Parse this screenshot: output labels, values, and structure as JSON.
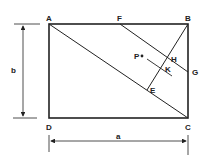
{
  "diagram": {
    "type": "rectangle-geometry",
    "labels": {
      "A": "A",
      "B": "B",
      "C": "C",
      "D": "D",
      "E": "E",
      "F": "F",
      "G": "G",
      "H": "H",
      "K": "K",
      "P": "P"
    },
    "dimensions": {
      "height": "b",
      "width": "a"
    },
    "segments": [
      "AB",
      "BC",
      "CD",
      "DA",
      "AC",
      "FG",
      "BE",
      "line through P and K parallel to FG"
    ]
  }
}
